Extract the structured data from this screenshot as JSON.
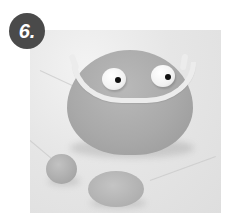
{
  "step": {
    "label": "6.",
    "badge_color": "#4a4a4a",
    "badge_text_color": "#ffffff"
  },
  "photo": {
    "description": "Grayscale photo of a clay figure: a rounded gray clay blob with two white googly eyes and a thin white clay strip forming a frame/mouth, plus a small gray clay ball and a flattened gray clay disc on a marble surface",
    "background_color": "#e4e4e4",
    "clay_color": "#a9a9a9",
    "strip_color": "#ececec",
    "elements": [
      "clay-body",
      "left-eye",
      "right-eye",
      "white-clay-strip",
      "small-clay-ball",
      "flat-clay-disc"
    ]
  }
}
